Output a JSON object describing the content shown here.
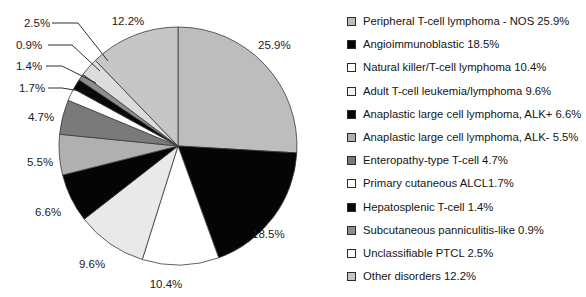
{
  "chart_data": {
    "type": "pie",
    "title": "",
    "subtitle": "",
    "xlabel": "",
    "ylabel": "",
    "legend_position": "right",
    "grid": false,
    "units": "percent",
    "start_angle_deg": -90,
    "direction": "clockwise",
    "categories": [
      "Peripheral T-cell lymphoma - NOS",
      "Angioimmunoblastic",
      "Natural killer/T-cell lymphoma",
      "Adult T-cell leukemia/lymphoma",
      "Anaplastic large cell lymphoma, ALK+",
      "Anaplastic large cell lymphoma, ALK-",
      "Enteropathy-type T-cell",
      "Primary cutaneous ALCL",
      "Hepatosplenic T-cell",
      "Subcutaneous panniculitis-like",
      "Unclassifiable PTCL",
      "Other disorders"
    ],
    "values": [
      25.9,
      18.5,
      10.4,
      9.6,
      6.6,
      5.5,
      4.7,
      1.7,
      1.4,
      0.9,
      2.5,
      12.2
    ],
    "slice_colors": [
      "#bdbdbd",
      "#050505",
      "#ffffff",
      "#e9e9e9",
      "#050505",
      "#b0b0b0",
      "#7a7a7a",
      "#ffffff",
      "#080808",
      "#8e8e8e",
      "#dcdcdc",
      "#c6c6c6"
    ],
    "slice_labels": [
      "25.9%",
      "18.5%",
      "10.4%",
      "9.6%",
      "6.6%",
      "5.5%",
      "4.7%",
      "1.7%",
      "1.4%",
      "0.9%",
      "2.5%",
      "12.2%"
    ]
  },
  "legend": {
    "items": [
      {
        "label": "Peripheral T-cell lymphoma - NOS 25.9%",
        "swatch": "#bdbdbd"
      },
      {
        "label": "Angioimmunoblastic 18.5%",
        "swatch": "#050505"
      },
      {
        "label": "Natural killer/T-cell lymphoma 10.4%",
        "swatch": "#ffffff"
      },
      {
        "label": "Adult T-cell leukemia/lymphoma 9.6%",
        "swatch": "#f2f2f2"
      },
      {
        "label": "Anaplastic large cell lymphoma, ALK+ 6.6%",
        "swatch": "#050505"
      },
      {
        "label": "Anaplastic large cell lymphoma, ALK- 5.5%",
        "swatch": "#b0b0b0"
      },
      {
        "label": "Enteropathy-type T-cell 4.7%",
        "swatch": "#7a7a7a"
      },
      {
        "label": "Primary cutaneous ALCL1.7%",
        "swatch": "#ffffff"
      },
      {
        "label": "Hepatosplenic T-cell 1.4%",
        "swatch": "#080808"
      },
      {
        "label": "Subcutaneous panniculitis-like 0.9%",
        "swatch": "#8e8e8e"
      },
      {
        "label": "Unclassifiable PTCL 2.5%",
        "swatch": "#fbfbfb"
      },
      {
        "label": "Other disorders 12.2%",
        "swatch": "#c6c6c6"
      }
    ]
  },
  "pie_labels": [
    {
      "text": "25.9%",
      "x": 258,
      "y": 49,
      "anchor": "start"
    },
    {
      "text": "18.5%",
      "x": 252,
      "y": 238,
      "anchor": "start"
    },
    {
      "text": "10.4%",
      "x": 166,
      "y": 288,
      "anchor": "middle"
    },
    {
      "text": "9.6%",
      "x": 92,
      "y": 268,
      "anchor": "middle"
    },
    {
      "text": "6.6%",
      "x": 48,
      "y": 216,
      "anchor": "middle"
    },
    {
      "text": "5.5%",
      "x": 40,
      "y": 166,
      "anchor": "middle"
    },
    {
      "text": "4.7%",
      "x": 41,
      "y": 121,
      "anchor": "middle"
    },
    {
      "text": "1.7%",
      "x": 32,
      "y": 92,
      "anchor": "middle"
    },
    {
      "text": "1.4%",
      "x": 29,
      "y": 70,
      "anchor": "middle"
    },
    {
      "text": "0.9%",
      "x": 29,
      "y": 49,
      "anchor": "middle"
    },
    {
      "text": "2.5%",
      "x": 37,
      "y": 27,
      "anchor": "middle"
    },
    {
      "text": "12.2%",
      "x": 128,
      "y": 25,
      "anchor": "middle"
    }
  ],
  "leader_lines": [
    {
      "name": "leader-2-5",
      "points": "52,23 78,23 108,61"
    },
    {
      "name": "leader-0-9",
      "points": "48,45 72,45 100,71"
    },
    {
      "name": "leader-1-4",
      "points": "46,66 62,66 96,83"
    },
    {
      "name": "leader-1-7",
      "points": "48,88 62,88 93,93"
    }
  ],
  "geometry": {
    "center_x": 178,
    "center_y": 146,
    "radius": 119
  }
}
